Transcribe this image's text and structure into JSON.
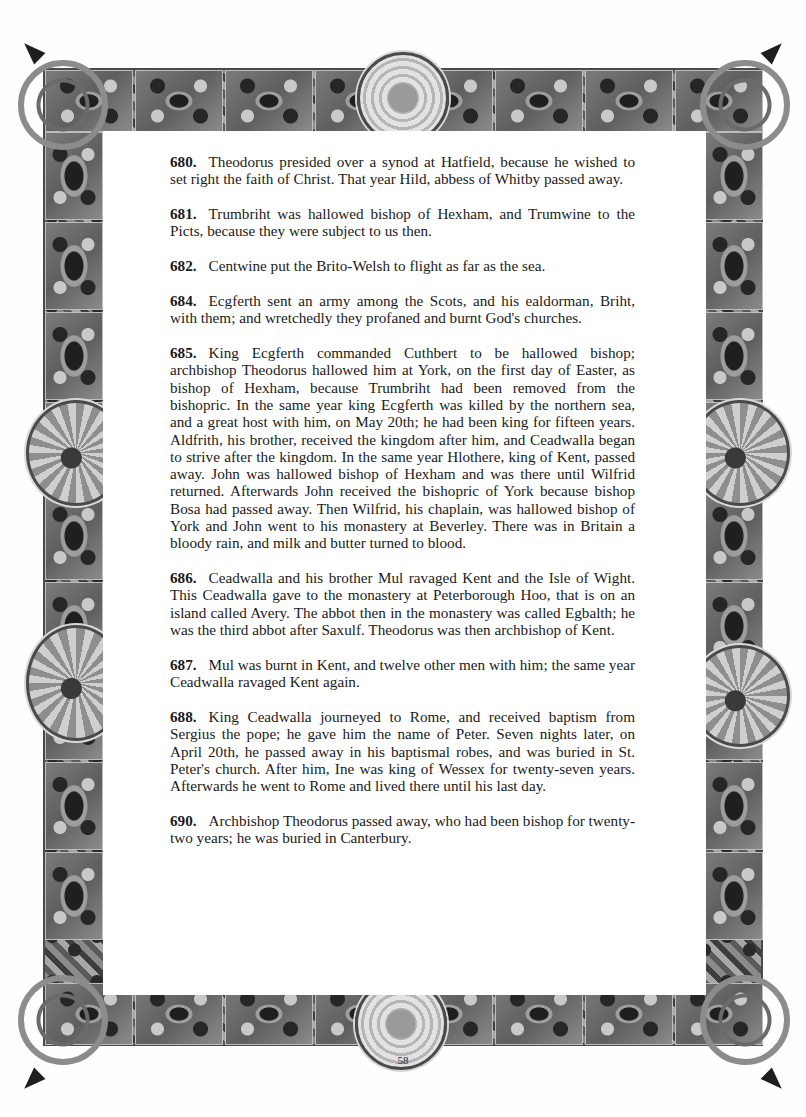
{
  "document": {
    "page_number": "58",
    "entries": [
      {
        "year": "680.",
        "text": "Theodorus presided over a synod at Hatfield, because he wished to set right the faith of Christ. That year Hild, abbess of Whitby passed away."
      },
      {
        "year": "681.",
        "text": "Trumbriht was hallowed bishop of Hexham, and Trumwine to the Picts, because they were subject to us then."
      },
      {
        "year": "682.",
        "text": "Centwine put the Brito-Welsh to flight as far as the sea."
      },
      {
        "year": "684.",
        "text": "Ecgferth sent an army among the Scots, and his ealdorman, Briht, with them; and wretchedly they profaned and burnt God's churches."
      },
      {
        "year": "685.",
        "text": "King Ecgferth commanded Cuthbert to be hallowed bishop; archbishop Theodorus hallowed him at York, on the first day of Easter, as bishop of Hexham, because Trumbriht had been removed from the bishopric. In the same year king Ecgferth was killed by the northern sea, and a great host with him, on May 20th; he had been king for fifteen years. Aldfrith, his brother, received the kingdom after him, and Ceadwalla began to strive after the kingdom. In the same year Hlothere, king of Kent, passed away. John was hallowed bishop of Hexham and was there until Wilfrid returned. Afterwards John received the bishopric of York because bishop Bosa had passed away. Then Wilfrid, his chaplain, was hallowed bishop of York and John went to his monastery at Beverley. There was in Britain a bloody rain, and milk and butter turned to blood."
      },
      {
        "year": "686.",
        "text": "Ceadwalla and his brother Mul ravaged Kent and the Isle of Wight. This Ceadwalla gave to the monastery at Peterborough Hoo, that is on an island called Avery. The abbot then in the monastery was called Egbalth; he was the third abbot after Saxulf. Theodorus was then archbishop of Kent."
      },
      {
        "year": "687.",
        "text": "Mul was burnt in Kent, and twelve other men with him; the same year Ceadwalla ravaged Kent again."
      },
      {
        "year": "688.",
        "text": "King Ceadwalla journeyed to Rome, and received baptism from Sergius the pope; he gave him the name of Peter. Seven nights later, on April 20th, he passed away in his baptismal robes, and was buried in St. Peter's church. After him, Ine was king of Wessex for twenty-seven years. Afterwards he went to Rome and lived there until his last day."
      },
      {
        "year": "690.",
        "text": "Archbishop Theodorus passed away, who had been bishop for twenty-two years; he was buried in Canterbury."
      }
    ]
  },
  "decoration": {
    "style": "illuminated-celtic-border",
    "palette": {
      "dark": "#1f1f1f",
      "mid": "#6f6f6f",
      "light": "#c9c9c9",
      "paper": "#ffffff",
      "text": "#1a1a1a"
    }
  }
}
